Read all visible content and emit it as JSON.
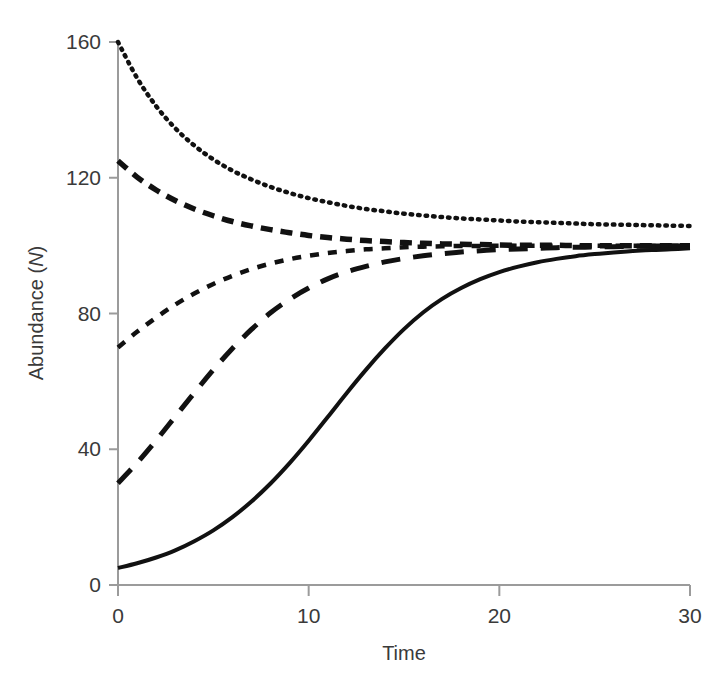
{
  "chart_data": {
    "type": "line",
    "title": "",
    "subtitle": "",
    "xlabel": "Time",
    "ylabel": "Abundance (N)",
    "ylabel_plain": "Abundance (",
    "ylabel_italic": "N",
    "ylabel_close": ")",
    "xlim": [
      0,
      30
    ],
    "ylim": [
      0,
      160
    ],
    "xticks": [
      0,
      10,
      20,
      30
    ],
    "xtick_labels": [
      "0",
      "10",
      "20",
      "30"
    ],
    "yticks": [
      0,
      40,
      80,
      120,
      160
    ],
    "ytick_labels": [
      "0",
      "40",
      "80",
      "120",
      "160"
    ],
    "grid": false,
    "legend": "none",
    "legend_position": "none",
    "model": "logistic growth",
    "carrying_capacity": 100,
    "growth_rate": 0.25,
    "x": [
      0,
      1,
      2,
      3,
      4,
      5,
      6,
      7,
      8,
      9,
      10,
      11,
      12,
      13,
      14,
      15,
      16,
      17,
      18,
      19,
      20,
      21,
      22,
      23,
      24,
      25,
      26,
      27,
      28,
      29,
      30
    ],
    "series": [
      {
        "name": "N0 = 160",
        "initial_value": 160,
        "style": "dotted",
        "color": "#111111",
        "values": [
          160,
          149.4,
          141.1,
          134.6,
          129.5,
          125.4,
          122.1,
          119.5,
          117.3,
          115.5,
          114.0,
          112.8,
          111.7,
          110.8,
          110.1,
          109.4,
          108.9,
          108.4,
          108.0,
          107.7,
          107.4,
          107.1,
          106.9,
          106.7,
          106.5,
          106.3,
          106.2,
          106.1,
          106.0,
          105.9,
          105.8
        ]
      },
      {
        "name": "N0 = 125",
        "initial_value": 125,
        "style": "medium-dash",
        "color": "#111111",
        "values": [
          125,
          120.2,
          116.4,
          113.3,
          110.8,
          108.8,
          107.1,
          105.8,
          104.7,
          103.8,
          103.0,
          102.4,
          101.9,
          101.5,
          101.2,
          100.9,
          100.7,
          100.5,
          100.4,
          100.3,
          100.2,
          100.1,
          100.1,
          100.1,
          100.0,
          100.0,
          100.0,
          100.0,
          100.0,
          100.0,
          100.0
        ]
      },
      {
        "name": "N0 = 70",
        "initial_value": 70,
        "style": "short-dash",
        "color": "#111111",
        "values": [
          70,
          74.6,
          78.8,
          82.6,
          85.9,
          88.7,
          91.1,
          93.1,
          94.7,
          96.0,
          97.0,
          97.8,
          98.4,
          98.9,
          99.2,
          99.5,
          99.7,
          99.8,
          99.9,
          99.9,
          100.0,
          100.0,
          100.0,
          100.0,
          100.0,
          100.0,
          100.0,
          100.0,
          100.0,
          100.0,
          100.0
        ]
      },
      {
        "name": "N0 = 30",
        "initial_value": 30,
        "style": "long-dash",
        "color": "#111111",
        "values": [
          30,
          36.0,
          42.6,
          49.6,
          56.6,
          63.4,
          69.7,
          75.3,
          80.2,
          84.2,
          87.5,
          90.2,
          92.3,
          93.9,
          95.2,
          96.2,
          97.0,
          97.6,
          98.1,
          98.5,
          98.8,
          99.0,
          99.2,
          99.4,
          99.5,
          99.6,
          99.7,
          99.8,
          99.8,
          99.9,
          99.9
        ]
      },
      {
        "name": "N0 = 5",
        "initial_value": 5,
        "style": "solid",
        "color": "#111111",
        "values": [
          5,
          6.4,
          8.1,
          10.2,
          12.9,
          16.1,
          20.0,
          24.6,
          29.9,
          35.9,
          42.5,
          49.5,
          56.6,
          63.4,
          69.7,
          75.4,
          80.3,
          84.3,
          87.5,
          90.1,
          92.2,
          93.8,
          95.1,
          96.1,
          96.9,
          97.5,
          98.0,
          98.4,
          98.7,
          98.9,
          99.2
        ]
      }
    ]
  },
  "colors": {
    "axis": "#9b9b9b",
    "text": "#3a3a3a",
    "curve": "#111111",
    "background": "#ffffff"
  },
  "geometry": {
    "x0_px": 118,
    "x1_px": 690,
    "y0_px": 585,
    "ytop_px": 42
  }
}
